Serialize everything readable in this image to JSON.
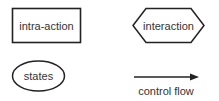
{
  "legend": {
    "items": [
      {
        "shape": "rectangle",
        "label": "intra-action"
      },
      {
        "shape": "hexagon",
        "label": "interaction"
      },
      {
        "shape": "ellipse",
        "label": "states"
      },
      {
        "shape": "arrow",
        "label": "control flow"
      }
    ]
  },
  "colors": {
    "stroke": "#222222",
    "text": "#333333",
    "background": "#ffffff"
  }
}
